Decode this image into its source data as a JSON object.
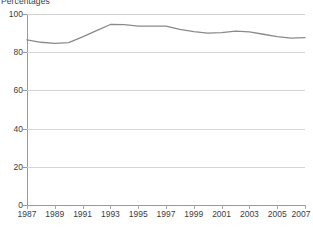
{
  "chart_data": {
    "type": "line",
    "title": "Percentages",
    "xlabel": "",
    "ylabel": "Percentages",
    "xlim": [
      1987,
      2007
    ],
    "ylim": [
      0,
      100
    ],
    "grid": true,
    "legend": "none",
    "y_ticks": [
      0,
      20,
      40,
      60,
      80,
      100
    ],
    "x_ticks": [
      1987,
      1989,
      1991,
      1993,
      1995,
      1997,
      1999,
      2001,
      2003,
      2005,
      2007
    ],
    "x_tick_labels": [
      "1987",
      "1989",
      "1991",
      "1993",
      "1995",
      "1997",
      "1999",
      "2001",
      "2003",
      "2005",
      "2007"
    ],
    "y_tick_labels": [
      "0",
      "20",
      "40",
      "60",
      "80",
      "100"
    ],
    "x": [
      1987,
      1988,
      1989,
      1990,
      1991,
      1992,
      1993,
      1994,
      1995,
      1996,
      1997,
      1998,
      1999,
      2000,
      2001,
      2002,
      2003,
      2004,
      2005,
      2006,
      2007
    ],
    "series": [
      {
        "name": "Percentage",
        "color": "#8a8a8a",
        "values": [
          86.5,
          85.2,
          84.6,
          85.0,
          88.0,
          91.3,
          94.5,
          94.4,
          93.7,
          93.6,
          93.7,
          92.0,
          90.8,
          90.0,
          90.3,
          91.0,
          90.6,
          89.4,
          88.2,
          87.4,
          87.6
        ]
      }
    ]
  },
  "colors": {
    "line": "#8a8a8a",
    "gridline": "#d4d4d4",
    "axis": "#9a9a9a",
    "text": "#3d3d3d",
    "background": "#ffffff"
  }
}
